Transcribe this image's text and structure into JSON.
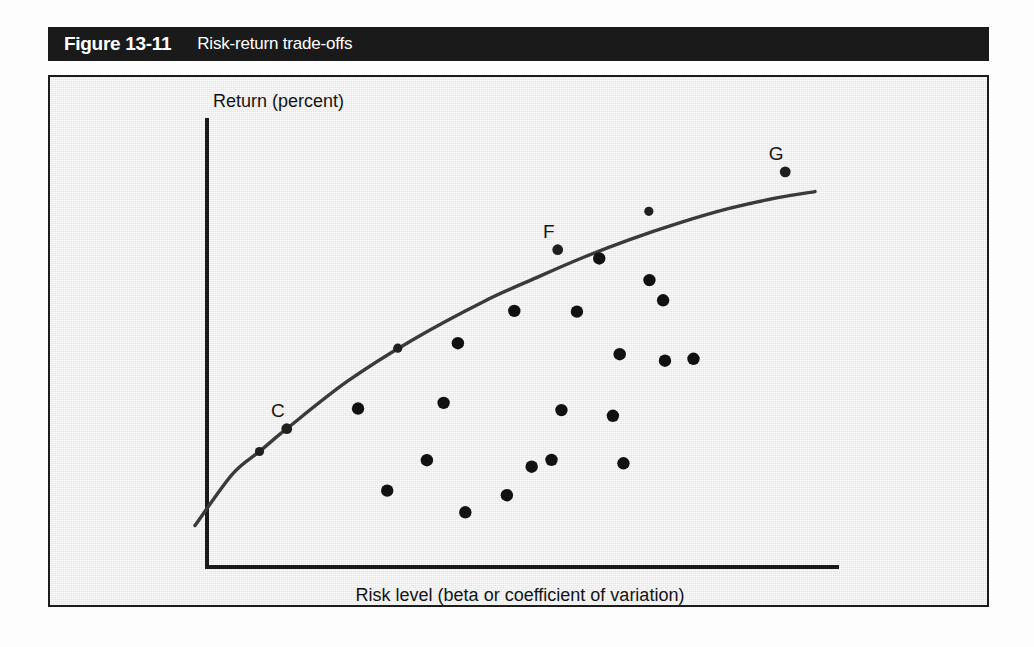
{
  "figure": {
    "number": "Figure 13-11",
    "title": "Risk-return trade-offs"
  },
  "axes": {
    "y_label": "Return (percent)",
    "x_label": "Risk level (beta or coefficient of variation)"
  },
  "colors": {
    "caption_bar": "#1a1a1a",
    "caption_text": "#ffffff",
    "panel_background": "#eeeeee",
    "panel_border": "#1c1c1c",
    "axis": "#1a1a1a",
    "curve": "#3a3a3a",
    "dot": "#111111"
  },
  "point_labels": {
    "c": "C",
    "f": "F",
    "g": "G"
  },
  "chart_data": {
    "type": "scatter",
    "title": "Risk-return trade-offs",
    "xlabel": "Risk level (beta or coefficient of variation)",
    "ylabel": "Return (percent)",
    "grid": false,
    "legend": "none",
    "axis_ticks": [],
    "xlim": [
      0,
      100
    ],
    "ylim": [
      0,
      100
    ],
    "curve": {
      "name": "Efficient frontier",
      "x": [
        0.0,
        6.0,
        10.4,
        14.8,
        24.6,
        35.0,
        46.6,
        55.0,
        62.2,
        70.0,
        78.0,
        86.0,
        94.0,
        100.0
      ],
      "y": [
        3.0,
        16.5,
        22.5,
        28.5,
        41.0,
        51.8,
        62.0,
        68.2,
        73.3,
        78.2,
        82.6,
        86.4,
        89.3,
        90.9
      ]
    },
    "curve_points": [
      {
        "label": "",
        "x": 10.4,
        "y": 22.5
      },
      {
        "label": "C",
        "x": 14.8,
        "y": 28.5
      },
      {
        "label": "",
        "x": 32.7,
        "y": 49.7
      },
      {
        "label": "F",
        "x": 58.5,
        "y": 75.6
      },
      {
        "label": "",
        "x": 73.2,
        "y": 85.7
      },
      {
        "label": "G",
        "x": 95.2,
        "y": 96.1
      }
    ],
    "scatter_points": [
      {
        "x": 26.3,
        "y": 33.8
      },
      {
        "x": 37.4,
        "y": 20.2
      },
      {
        "x": 31.0,
        "y": 12.2
      },
      {
        "x": 42.4,
        "y": 51.0
      },
      {
        "x": 40.1,
        "y": 35.3
      },
      {
        "x": 43.6,
        "y": 6.5
      },
      {
        "x": 51.5,
        "y": 59.5
      },
      {
        "x": 54.3,
        "y": 18.5
      },
      {
        "x": 50.3,
        "y": 11.0
      },
      {
        "x": 61.6,
        "y": 59.3
      },
      {
        "x": 59.1,
        "y": 33.4
      },
      {
        "x": 57.5,
        "y": 20.3
      },
      {
        "x": 65.2,
        "y": 73.3
      },
      {
        "x": 68.5,
        "y": 48.1
      },
      {
        "x": 67.4,
        "y": 31.9
      },
      {
        "x": 69.1,
        "y": 19.4
      },
      {
        "x": 73.3,
        "y": 67.6
      },
      {
        "x": 75.5,
        "y": 62.3
      },
      {
        "x": 75.8,
        "y": 46.4
      },
      {
        "x": 80.4,
        "y": 46.9
      }
    ]
  }
}
